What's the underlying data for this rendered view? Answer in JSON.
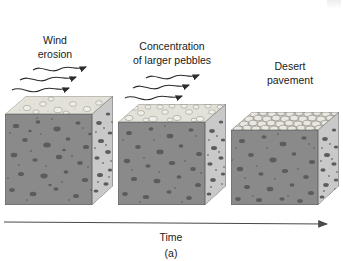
{
  "figure": {
    "caption": "(a)",
    "axis": {
      "label": "Time",
      "direction": "left-to-right",
      "arrowhead": "arrow-right-icon"
    },
    "background_color": "#ffffff",
    "text_color": "#1a1a1a"
  },
  "palette": {
    "front_face": "#8a8a8a",
    "front_face_shadow": "#7c7c7c",
    "side_face": "#c9c9c9",
    "side_face_shadow": "#bdbdbd",
    "top_surface": "#e4e1d8",
    "top_surface_shade": "#d5d2c8",
    "pebble_dark": "#5a5a5a",
    "pebble_mid": "#6f6f6f",
    "pebble_light": "#efefe9",
    "pebble_outline": "#8c8c86",
    "cobble_fill": "#e9e7df",
    "cobble_outline": "#7d7d78",
    "outline": "#555555",
    "arrow_color": "#2b2b2b",
    "axis_color": "#4a4a4a"
  },
  "stages": [
    {
      "id": "stage-1",
      "label_line1": "Wind",
      "label_line2": "erosion",
      "description": "Mixed sediment with scattered pebbles at the surface; wind begins removing fine particles",
      "wind_arrows": 3,
      "surface_type": "scattered-pebbles",
      "surface_pebble_count": 9
    },
    {
      "id": "stage-2",
      "label_line1": "Concentration",
      "label_line2": "of larger pebbles",
      "description": "Continued deflation removes sand and silt, leaving larger pebbles concentrated at the surface",
      "wind_arrows": 3,
      "surface_type": "concentrated-pebbles",
      "surface_pebble_count": 20
    },
    {
      "id": "stage-3",
      "label_line1": "Desert",
      "label_line2": "pavement",
      "description": "Closely packed cobbles form an armored surface layer that protects underlying sediment",
      "wind_arrows": 0,
      "surface_type": "packed-cobble-armor",
      "surface_pebble_count": 70
    }
  ]
}
